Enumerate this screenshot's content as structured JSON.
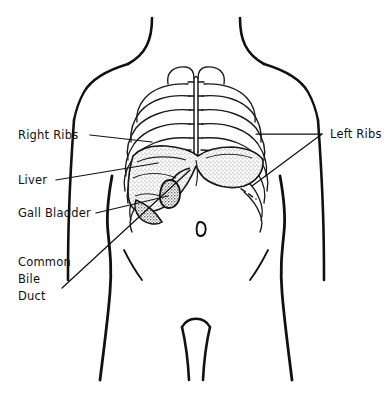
{
  "figure": {
    "name": "upper-abdominal-anatomy-diagram",
    "background_color": "#ffffff",
    "ink_color": "#111111",
    "liver_fill_color": "#b9b9b9",
    "gallbladder_fill_color": "#4a4a4a"
  },
  "labels": {
    "right_ribs": "Right Ribs",
    "left_ribs": "Left Ribs",
    "liver": "Liver",
    "gall_bladder": "Gall Bladder",
    "common_bile_duct_line1": "Common",
    "common_bile_duct_line2": "Bile",
    "common_bile_duct_line3": "Duct"
  },
  "structures": {
    "ribcage": "ribcage",
    "sternum": "sternum",
    "liver": "liver",
    "gallbladder": "gallbladder",
    "navel": "navel",
    "torso": "torso-outline",
    "left_arm": "left-arm",
    "right_arm": "right-arm",
    "costal_margin": "costal-margin-dashed"
  }
}
